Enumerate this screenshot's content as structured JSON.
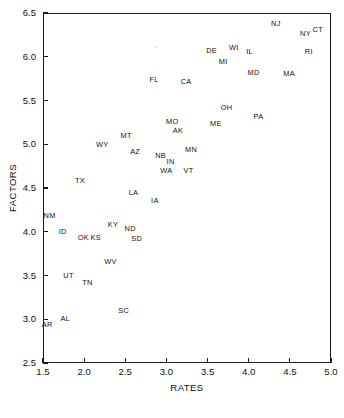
{
  "chart_data": {
    "type": "scatter",
    "title": "",
    "xlabel": "RATES",
    "ylabel": "FACTORS",
    "xlim": [
      1.5,
      5.0
    ],
    "ylim": [
      2.5,
      6.5
    ],
    "xticks": [
      "1.5",
      "2.0",
      "2.5",
      "3.0",
      "3.5",
      "4.0",
      "4.5",
      "5.0"
    ],
    "yticks": [
      "2.5",
      "3.0",
      "3.5",
      "4.0",
      "4.5",
      "5.0",
      "5.5",
      "6.0",
      "6.5"
    ],
    "xtick_values": [
      1.5,
      2.0,
      2.5,
      3.0,
      3.5,
      4.0,
      4.5,
      5.0
    ],
    "ytick_values": [
      2.5,
      3.0,
      3.5,
      4.0,
      4.5,
      5.0,
      5.5,
      6.0,
      6.5
    ],
    "grid": false,
    "legend": null,
    "marker_style": "text-label",
    "points": [
      {
        "label": "NJ",
        "x": 4.33,
        "y": 6.38
      },
      {
        "label": "NY",
        "x": 4.69,
        "y": 6.26
      },
      {
        "label": "CT",
        "x": 4.84,
        "y": 6.31
      },
      {
        "label": "RI",
        "x": 4.73,
        "y": 6.06
      },
      {
        "label": "WI",
        "x": 3.82,
        "y": 6.1
      },
      {
        "label": "IL",
        "x": 4.01,
        "y": 6.06
      },
      {
        "label": "DE",
        "x": 3.55,
        "y": 6.07
      },
      {
        "label": "MI",
        "x": 3.69,
        "y": 5.94
      },
      {
        "label": "MD",
        "x": 4.06,
        "y": 5.82
      },
      {
        "label": "MA",
        "x": 4.49,
        "y": 5.8
      },
      {
        "label": "FL",
        "x": 2.85,
        "y": 5.73
      },
      {
        "label": "CA",
        "x": 3.24,
        "y": 5.71
      },
      {
        "label": "OH",
        "x": 3.73,
        "y": 5.41
      },
      {
        "label": "PA",
        "x": 4.12,
        "y": 5.31
      },
      {
        "label": "ME",
        "x": 3.6,
        "y": 5.23
      },
      {
        "label": "MO",
        "x": 3.07,
        "y": 5.26
      },
      {
        "label": "AK",
        "x": 3.14,
        "y": 5.15
      },
      {
        "label": "MT",
        "x": 2.51,
        "y": 5.09
      },
      {
        "label": "WY",
        "x": 2.22,
        "y": 4.99
      },
      {
        "label": "MN",
        "x": 3.3,
        "y": 4.94
      },
      {
        "label": "AZ",
        "x": 2.62,
        "y": 4.91
      },
      {
        "label": "NB",
        "x": 2.93,
        "y": 4.87
      },
      {
        "label": "IN",
        "x": 3.05,
        "y": 4.8
      },
      {
        "label": "WA",
        "x": 3.0,
        "y": 4.7
      },
      {
        "label": "VT",
        "x": 3.27,
        "y": 4.7
      },
      {
        "label": "TX",
        "x": 1.95,
        "y": 4.58
      },
      {
        "label": "LA",
        "x": 2.6,
        "y": 4.44
      },
      {
        "label": "IA",
        "x": 2.86,
        "y": 4.35
      },
      {
        "label": "NM",
        "x": 1.58,
        "y": 4.18
      },
      {
        "label": "KY",
        "x": 2.35,
        "y": 4.08
      },
      {
        "label": "ID",
        "x": 1.74,
        "y": 4.0
      },
      {
        "label": "ND",
        "x": 2.56,
        "y": 4.03
      },
      {
        "label": "OK",
        "x": 1.99,
        "y": 3.93
      },
      {
        "label": "KS",
        "x": 2.14,
        "y": 3.93
      },
      {
        "label": "SD",
        "x": 2.64,
        "y": 3.92
      },
      {
        "label": "WV",
        "x": 2.32,
        "y": 3.66
      },
      {
        "label": "UT",
        "x": 1.81,
        "y": 3.49
      },
      {
        "label": "TN",
        "x": 2.04,
        "y": 3.42
      },
      {
        "label": "SC",
        "x": 2.48,
        "y": 3.1
      },
      {
        "label": "AL",
        "x": 1.77,
        "y": 3.0
      },
      {
        "label": "AR",
        "x": 1.55,
        "y": 2.93
      }
    ]
  }
}
